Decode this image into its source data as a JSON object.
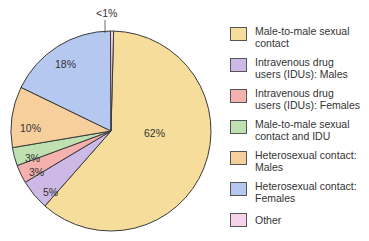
{
  "chart_data": {
    "type": "pie",
    "title": "",
    "categories": [
      "Male-to-male sexual contact",
      "Intravenous drug users (IDUs): Males",
      "Intravenous drug users (IDUs): Females",
      "Male-to-male sexual contact and IDU",
      "Heterosexual contact: Males",
      "Heterosexual contact: Females",
      "Other"
    ],
    "values": [
      62,
      5,
      3,
      3,
      10,
      18,
      0.5
    ],
    "labels": [
      "62%",
      "5%",
      "3%",
      "3%",
      "10%",
      "18%",
      "<1%"
    ],
    "colors": [
      "#f7dd9b",
      "#cdb9e6",
      "#f4b1ad",
      "#bfe0b1",
      "#f6cf9c",
      "#b5c8f0",
      "#f6d3ec"
    ],
    "legend_position": "right"
  },
  "legend": {
    "items": [
      {
        "label_line1": "Male-to-male sexual",
        "label_line2": "contact",
        "color": "#f7dd9b"
      },
      {
        "label_line1": "Intravenous drug",
        "label_line2": "users (IDUs): Males",
        "color": "#cdb9e6"
      },
      {
        "label_line1": "Intravenous drug",
        "label_line2": "users (IDUs): Females",
        "color": "#f4b1ad"
      },
      {
        "label_line1": "Male-to-male sexual",
        "label_line2": "contact and IDU",
        "color": "#bfe0b1"
      },
      {
        "label_line1": "Heterosexual contact:",
        "label_line2": "Males",
        "color": "#f6cf9c"
      },
      {
        "label_line1": "Heterosexual contact:",
        "label_line2": "Females",
        "color": "#b5c8f0"
      },
      {
        "label_line1": "Other",
        "label_line2": "",
        "color": "#f6d3ec"
      }
    ]
  }
}
